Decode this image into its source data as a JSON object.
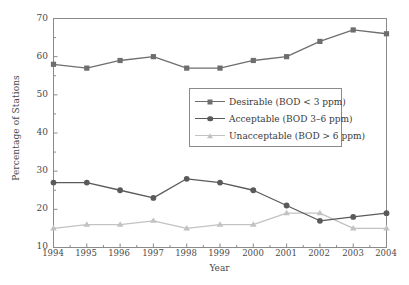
{
  "chart_data": {
    "type": "line",
    "title": "",
    "xlabel": "Year",
    "ylabel": "Percentage of Stations",
    "x": [
      1994,
      1995,
      1996,
      1997,
      1998,
      1999,
      2000,
      2001,
      2002,
      2003,
      2004
    ],
    "categories": [
      "1994",
      "1995",
      "1996",
      "1997",
      "1998",
      "1999",
      "2000",
      "2001",
      "2002",
      "2003",
      "2004"
    ],
    "xlim": [
      1994,
      2004
    ],
    "ylim": [
      10,
      70
    ],
    "yticks": [
      10,
      20,
      30,
      40,
      50,
      60,
      70
    ],
    "ytick_labels": [
      "10",
      "20",
      "30",
      "40",
      "50",
      "60",
      "70"
    ],
    "grid": false,
    "legend_position": "center",
    "series": [
      {
        "name": "Desirable (BOD < 3 ppm)",
        "marker": "square",
        "color": "#6e6e6e",
        "values": [
          58,
          57,
          59,
          60,
          57,
          57,
          59,
          60,
          64,
          67,
          66
        ]
      },
      {
        "name": "Acceptable (BOD 3–6 ppm)",
        "marker": "circle",
        "color": "#5a5a5a",
        "values": [
          27,
          27,
          25,
          23,
          28,
          27,
          25,
          21,
          17,
          18,
          19
        ]
      },
      {
        "name": "Unacceptable (BOD > 6 ppm)",
        "marker": "triangle",
        "color": "#c2c2c2",
        "values": [
          15,
          16,
          16,
          17,
          15,
          16,
          16,
          19,
          19,
          15,
          15
        ]
      }
    ]
  },
  "axes": {
    "frame_color": "#8a8a8a"
  },
  "legend": {
    "entries": [
      "Desirable (BOD < 3 ppm)",
      "Acceptable (BOD 3–6 ppm)",
      "Unacceptable (BOD > 6 ppm)"
    ]
  }
}
